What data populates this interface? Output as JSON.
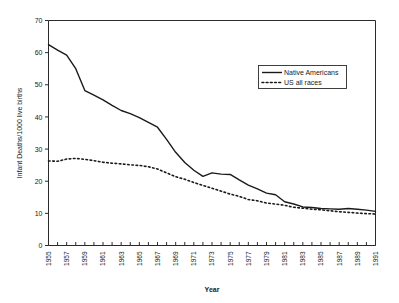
{
  "chart_data": {
    "type": "line",
    "title": "",
    "xlabel": "Year",
    "ylabel": "Infant Deaths/1000 live births",
    "xlim": [
      1955,
      1991
    ],
    "ylim": [
      0,
      70
    ],
    "ytick_values": [
      0,
      10,
      20,
      30,
      40,
      50,
      60,
      70
    ],
    "ytick_labels": [
      "0",
      "10",
      "20",
      "30",
      "40",
      "50",
      "60",
      "70"
    ],
    "x": [
      1955,
      1956,
      1957,
      1958,
      1959,
      1960,
      1961,
      1962,
      1963,
      1964,
      1965,
      1966,
      1967,
      1968,
      1969,
      1970,
      1971,
      1972,
      1973,
      1974,
      1975,
      1976,
      1977,
      1978,
      1979,
      1980,
      1981,
      1982,
      1983,
      1984,
      1985,
      1986,
      1987,
      1988,
      1989,
      1990,
      1991
    ],
    "xtick_labels": [
      "1955",
      "1957",
      "1959",
      "1961",
      "1963",
      "1965",
      "1967",
      "1969",
      "1971",
      "1973",
      "1975",
      "1977",
      "1979",
      "1981",
      "1983",
      "1985",
      "1987",
      "1989",
      "1991"
    ],
    "xtick_step": 2,
    "grid": false,
    "legend_position": "upper-right",
    "series": [
      {
        "name": "Native Americans",
        "style": "solid",
        "color": "#1a1a1a",
        "values": [
          62.5,
          60.8,
          59.2,
          55.0,
          48.2,
          46.8,
          45.3,
          43.6,
          42.0,
          41.0,
          39.8,
          38.3,
          36.8,
          33.0,
          29.0,
          25.8,
          23.4,
          21.5,
          22.6,
          22.2,
          22.1,
          20.4,
          18.8,
          17.6,
          16.3,
          15.8,
          13.6,
          12.9,
          12.0,
          11.8,
          11.5,
          11.4,
          11.3,
          11.5,
          11.3,
          11.0,
          10.6
        ]
      },
      {
        "name": "US  all races",
        "style": "dotted",
        "color": "#1a1a1a",
        "values": [
          26.3,
          26.2,
          26.9,
          27.1,
          26.8,
          26.4,
          25.9,
          25.6,
          25.4,
          25.1,
          24.9,
          24.5,
          23.8,
          22.6,
          21.4,
          20.6,
          19.6,
          18.7,
          17.8,
          16.9,
          16.0,
          15.3,
          14.3,
          13.9,
          13.2,
          12.9,
          12.5,
          11.9,
          11.6,
          11.3,
          11.1,
          10.8,
          10.5,
          10.3,
          10.1,
          9.9,
          9.8
        ]
      }
    ]
  },
  "legend": {
    "entries": [
      {
        "label": "Native Americans"
      },
      {
        "label": "US   all races"
      }
    ]
  }
}
